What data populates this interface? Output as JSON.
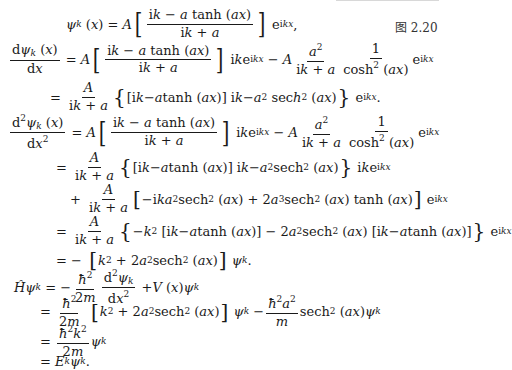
{
  "figure_label": "图 2.20",
  "equations": {
    "eq1": "ψ_k(x) = A [ (ik − a tanh(ax)) / (ik + a) ] e^{ikx},",
    "eq2": "dψ_k(x)/dx = A [ (ik − a tanh(ax)) / (ik + a) ] ik e^{ikx} − A a²/(ik + a) · 1/cosh²(ax) e^{ikx}",
    "eq3": "= A/(ik + a) { [ik − a tanh(ax)] ik − a² sec h²(ax) } e^{ikx}.",
    "eq4": "d²ψ_k(x)/dx² = A [ (ik − a tanh(ax)) / (ik + a) ] ik e^{ikx} − A a²/(ik + a) · 1/cosh²(ax) e^{ikx}",
    "eq5": "= A/(ik + a) { [ik − a tanh(ax)] ik − a² sech²(ax) } ik e^{ikx}",
    "eq6": "+ A/(ik + a) [ −ika² sech²(ax) + 2a³ sech²(ax) tanh(ax) ] e^{ikx}",
    "eq7": "= A/(ik + a) { −k² [ik − a tanh(ax)] − 2a² sech²(ax) [ik − a tanh(ax)] } e^{ikx}",
    "eq8": "= − [ k² + 2a² sech²(ax) ] ψ_k.",
    "eq9": "Ĥψ_k = −ħ²/2m · d²ψ_k/dx² + V(x) ψ_k",
    "eq10": "= ħ²/2m [ k² + 2a² sech²(ax) ] ψ_k − ħ²a²/m sech²(ax) ψ_k",
    "eq11": "= ħ²k²/2m ψ_k",
    "eq12": "= E_k ψ_k."
  }
}
